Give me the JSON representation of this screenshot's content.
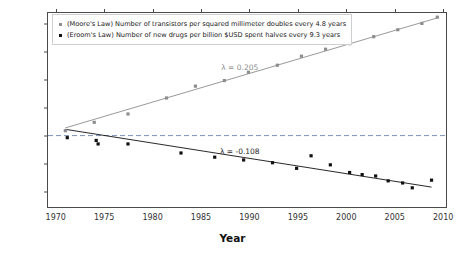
{
  "chart_data": {
    "type": "scatter",
    "title": "",
    "xlabel": "Year",
    "ylabel": "Normalized value",
    "xlim": [
      1969.2,
      2010.5
    ],
    "ylim": [
      -5.2,
      8.8
    ],
    "yscale": "log2",
    "grid": false,
    "legend_position": "top-left",
    "reference_line": {
      "y": 0,
      "style": "dashed",
      "color": "#6f86b8"
    },
    "xticks": [
      1970,
      1975,
      1980,
      1985,
      1990,
      1995,
      2000,
      2005,
      2010
    ],
    "xticklabels": [
      "1970",
      "1975",
      "1980",
      "1985",
      "1990",
      "1995",
      "2000",
      "2005",
      "2010"
    ],
    "yticks": [
      8,
      6,
      4,
      2,
      0,
      -2,
      -4
    ],
    "yticklabels": [
      "2⁸",
      "2⁶",
      "2⁴",
      "2²",
      "2⁰",
      "2⁻²",
      "2⁻⁴"
    ],
    "series": [
      {
        "name": "moore",
        "legend": "(Moore's Law) Number of transistors per squared millimeter doubles every 4.8 years",
        "color": "#8d8d8d",
        "marker": "square",
        "lambda": 0.205,
        "lambda_label": "λ = 0.205",
        "doubling_years": 4.8,
        "fit_line": {
          "x": [
            1971.0,
            2009.6
          ],
          "y": [
            0.55,
            8.45
          ]
        },
        "points": [
          {
            "x": 1971.0,
            "y": 0.35
          },
          {
            "x": 1974.0,
            "y": 0.95
          },
          {
            "x": 1977.5,
            "y": 1.55
          },
          {
            "x": 1981.5,
            "y": 2.7
          },
          {
            "x": 1984.5,
            "y": 3.55
          },
          {
            "x": 1987.5,
            "y": 3.95
          },
          {
            "x": 1990.0,
            "y": 4.55
          },
          {
            "x": 1993.0,
            "y": 5.05
          },
          {
            "x": 1995.5,
            "y": 5.7
          },
          {
            "x": 1998.0,
            "y": 6.2
          },
          {
            "x": 2000.5,
            "y": 6.6
          },
          {
            "x": 2003.0,
            "y": 7.1
          },
          {
            "x": 2005.5,
            "y": 7.6
          },
          {
            "x": 2008.0,
            "y": 8.05
          },
          {
            "x": 2009.6,
            "y": 8.5
          }
        ]
      },
      {
        "name": "eroom",
        "legend": "(Eroom's Law) Number of new drugs per billion $USD spent halves every 9.3 years",
        "color": "#111111",
        "marker": "square",
        "lambda": -0.108,
        "lambda_label": "λ = -0.108",
        "halving_years": 9.3,
        "fit_line": {
          "x": [
            1971.0,
            2009.0
          ],
          "y": [
            0.45,
            -3.7
          ]
        },
        "points": [
          {
            "x": 1971.2,
            "y": -0.15
          },
          {
            "x": 1974.2,
            "y": -0.35
          },
          {
            "x": 1974.4,
            "y": -0.6
          },
          {
            "x": 1977.5,
            "y": -0.6
          },
          {
            "x": 1983.0,
            "y": -1.25
          },
          {
            "x": 1986.5,
            "y": -1.55
          },
          {
            "x": 1989.5,
            "y": -1.75
          },
          {
            "x": 1992.5,
            "y": -1.95
          },
          {
            "x": 1995.0,
            "y": -2.35
          },
          {
            "x": 1996.5,
            "y": -1.45
          },
          {
            "x": 1998.5,
            "y": -2.1
          },
          {
            "x": 2000.5,
            "y": -2.65
          },
          {
            "x": 2001.8,
            "y": -2.8
          },
          {
            "x": 2003.2,
            "y": -2.9
          },
          {
            "x": 2004.5,
            "y": -3.25
          },
          {
            "x": 2006.0,
            "y": -3.4
          },
          {
            "x": 2007.0,
            "y": -3.75
          },
          {
            "x": 2009.0,
            "y": -3.2
          }
        ]
      }
    ]
  }
}
